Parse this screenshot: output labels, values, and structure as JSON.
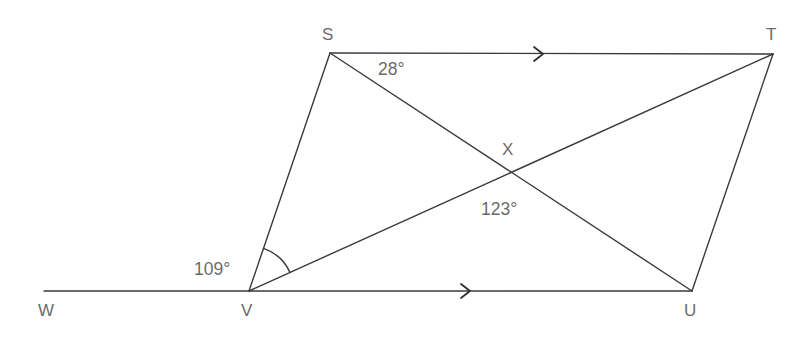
{
  "figure": {
    "type": "geometry-diagram",
    "background_color": "#ffffff",
    "line_color": "#3a3a3a",
    "label_color": "#6b6b6b",
    "vertices": [
      {
        "name": "S",
        "label": "S",
        "x": 330,
        "y": 53,
        "label_x": 322,
        "label_y": 26
      },
      {
        "name": "T",
        "label": "T",
        "x": 773,
        "y": 54,
        "label_x": 766,
        "label_y": 26
      },
      {
        "name": "U",
        "label": "U",
        "x": 692,
        "y": 291,
        "label_x": 684,
        "label_y": 302
      },
      {
        "name": "V",
        "label": "V",
        "x": 249,
        "y": 291,
        "label_x": 241,
        "label_y": 302
      },
      {
        "name": "W",
        "label": "W",
        "x": 44,
        "y": 291,
        "label_x": 38,
        "label_y": 302
      },
      {
        "name": "X",
        "label": "X",
        "x": 510,
        "y": 172,
        "label_x": 502,
        "label_y": 141
      }
    ],
    "segments": [
      {
        "name": "segment-S-T",
        "from": "S",
        "to": "T"
      },
      {
        "name": "segment-V-U",
        "from": "V",
        "to": "U"
      },
      {
        "name": "segment-S-V",
        "from": "S",
        "to": "V"
      },
      {
        "name": "segment-T-U",
        "from": "T",
        "to": "U"
      },
      {
        "name": "segment-S-U",
        "from": "S",
        "to": "U"
      },
      {
        "name": "segment-V-T",
        "from": "V",
        "to": "T"
      },
      {
        "name": "segment-W-V",
        "from": "W",
        "to": "V"
      }
    ],
    "parallel_marks": [
      {
        "name": "parallel-arrow-ST",
        "on_segment": "segment-S-T",
        "x": 540,
        "y": 54,
        "direction": "right",
        "glyph": "chevron-right-icon"
      },
      {
        "name": "parallel-arrow-VU",
        "on_segment": "segment-V-U",
        "x": 467,
        "y": 291,
        "direction": "right",
        "glyph": "chevron-right-icon"
      }
    ],
    "angle_arc": {
      "name": "angle-arc-at-V",
      "vertex": "V",
      "radius": 45,
      "from_ray": "V-S",
      "to_ray": "V-T"
    },
    "angle_labels": [
      {
        "name": "angle-label-28",
        "text": "28°",
        "value": 28,
        "at_vertex": "S",
        "x": 378,
        "y": 61
      },
      {
        "name": "angle-label-123",
        "text": "123°",
        "value": 123,
        "at_vertex": "X",
        "x": 481,
        "y": 201
      },
      {
        "name": "angle-label-109",
        "text": "109°",
        "value": 109,
        "at_vertex": "V",
        "x": 194,
        "y": 261
      }
    ]
  }
}
